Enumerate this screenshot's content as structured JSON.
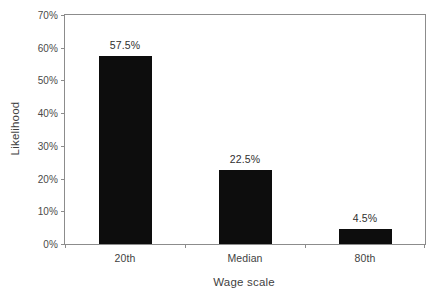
{
  "chart_data": {
    "type": "bar",
    "title": "",
    "subtitle": "",
    "xlabel": "Wage scale",
    "ylabel": "Likelihood",
    "categories": [
      "20th",
      "Median",
      "80th"
    ],
    "values": [
      57.5,
      22.5,
      4.5
    ],
    "value_labels": [
      "57.5%",
      "22.5%",
      "4.5%"
    ],
    "ylim": [
      0,
      70
    ],
    "ytick_values": [
      0,
      10,
      20,
      30,
      40,
      50,
      60,
      70
    ],
    "ytick_labels": [
      "0%",
      "10%",
      "20%",
      "30%",
      "40%",
      "50%",
      "60%",
      "70%"
    ],
    "grid": false,
    "legend": "none",
    "bar_color": "#0d0d0d",
    "axis_color": "#8c8c8c",
    "background_color": "#ffffff",
    "series": [
      {
        "name": "Likelihood",
        "values": [
          57.5,
          22.5,
          4.5
        ]
      }
    ]
  }
}
